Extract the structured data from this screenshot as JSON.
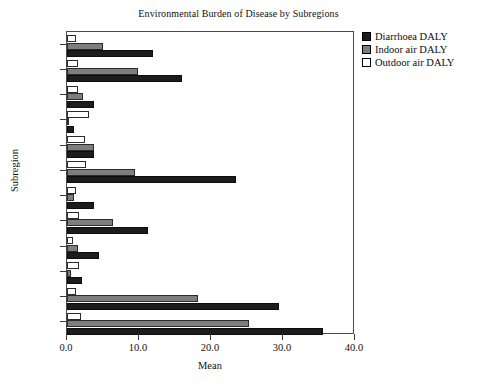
{
  "chart_data": {
    "type": "bar",
    "orientation": "horizontal",
    "title": "Environmental Burden of Disease by Subregions",
    "xlabel": "Mean",
    "ylabel": "Subregion",
    "xlim": [
      0.0,
      40.0
    ],
    "xticks": [
      "0.0",
      "10.0",
      "20.0",
      "30.0",
      "40.0"
    ],
    "xtick_values": [
      0,
      10,
      20,
      30,
      40
    ],
    "grid": false,
    "legend_position": "top-right",
    "categories": [
      "AfrD",
      "AfrE",
      "AmrA",
      "AmrB",
      "AmrD",
      "EmrB",
      "EmrD",
      "EurB",
      "EurC",
      "SearB",
      "SearD",
      "WprB"
    ],
    "series": [
      {
        "name": "Diarrhoea DALY",
        "color": "#1c1c1c",
        "values": [
          35.5,
          29.5,
          2.1,
          4.4,
          11.2,
          3.7,
          23.5,
          3.8,
          1.0,
          3.7,
          16.0,
          12.0
        ]
      },
      {
        "name": "Indoor air DALY",
        "color": "#7e7e7e",
        "values": [
          25.3,
          18.2,
          0.6,
          1.5,
          6.4,
          1.0,
          9.5,
          3.7,
          0.2,
          2.2,
          9.8,
          5.0
        ]
      },
      {
        "name": "Outdoor air DALY",
        "color": "#ffffff",
        "values": [
          1.9,
          1.3,
          1.6,
          0.9,
          1.6,
          1.3,
          2.7,
          2.5,
          3.1,
          1.5,
          1.5,
          1.2
        ]
      }
    ]
  },
  "legend": {
    "items": [
      {
        "label": "Diarrhoea DALY",
        "swatch": "#1c1c1c"
      },
      {
        "label": "Indoor air DALY",
        "swatch": "#7e7e7e"
      },
      {
        "label": "Outdoor air DALY",
        "swatch": "#ffffff"
      }
    ]
  }
}
